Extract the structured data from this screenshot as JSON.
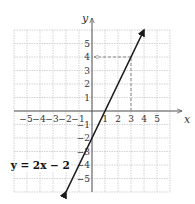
{
  "chart_data": {
    "type": "line",
    "title": "",
    "xlabel": "x",
    "ylabel": "y",
    "xlim": [
      -6,
      6
    ],
    "ylim": [
      -6,
      6
    ],
    "grid": true,
    "x_ticks": [
      "-5",
      "-4",
      "-3",
      "-2",
      "-1",
      "1",
      "2",
      "3",
      "4",
      "5"
    ],
    "y_ticks": [
      "5",
      "4",
      "3",
      "2",
      "1",
      "-1",
      "-2",
      "-3",
      "-4",
      "-5"
    ],
    "series": [
      {
        "name": "y = 2x - 2",
        "equation": "y = 2x − 2",
        "slope": 2,
        "intercept": -2,
        "x": [
          -2,
          4
        ],
        "y": [
          -6,
          6
        ],
        "arrows_both_ends": true
      }
    ],
    "annotations": [
      {
        "type": "dashed-guide",
        "from": [
          3,
          0
        ],
        "to": [
          3,
          4
        ],
        "label": "x = 3"
      },
      {
        "type": "dashed-guide-arrow",
        "from": [
          3,
          4
        ],
        "to": [
          0,
          4
        ],
        "label": "y = 4"
      }
    ],
    "colors": {
      "line": "#1a1a1a",
      "grid": "#c8c8c8",
      "guide": "#888888",
      "axes": "#555555"
    }
  }
}
